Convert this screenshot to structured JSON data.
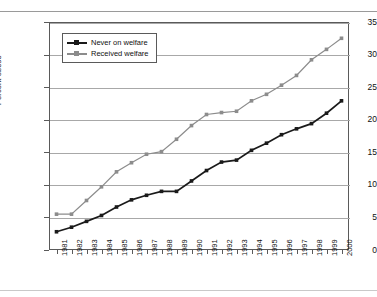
{
  "figure": {
    "top_rule": true,
    "bottom_rule": true,
    "ghost_text": ""
  },
  "legend": {
    "position": "top-left-inside",
    "entries": [
      {
        "label": "Never on welfare",
        "color": "#1a1a1a",
        "marker": "square"
      },
      {
        "label": "Received welfare",
        "color": "#8c8c8c",
        "marker": "square"
      }
    ]
  },
  "axes": {
    "y_title": "Percent obese",
    "y_ticks": [
      "0",
      "5",
      "10",
      "15",
      "20",
      "25",
      "30",
      "35"
    ],
    "x_ticks": [
      "1981",
      "1982",
      "1983",
      "1984",
      "1985",
      "1986",
      "1987",
      "1988",
      "1989",
      "1990",
      "1991",
      "1992",
      "1993",
      "1994",
      "1995",
      "1996",
      "1997",
      "1998",
      "1999",
      "2000"
    ]
  },
  "chart_data": {
    "type": "line",
    "title": "",
    "subtitle": "",
    "xlabel": "",
    "ylabel": "Percent obese",
    "xlim": [
      1981,
      2000
    ],
    "ylim": [
      0,
      35
    ],
    "y_ticks": [
      0,
      5,
      10,
      15,
      20,
      25,
      30,
      35
    ],
    "grid": "horizontal",
    "legend_position": "upper left (inside plot)",
    "x": [
      1981,
      1982,
      1983,
      1984,
      1985,
      1986,
      1987,
      1988,
      1989,
      1990,
      1991,
      1992,
      1993,
      1994,
      1995,
      1996,
      1997,
      1998,
      1999,
      2000
    ],
    "categories": [
      "1981",
      "1982",
      "1983",
      "1984",
      "1985",
      "1986",
      "1987",
      "1988",
      "1989",
      "1990",
      "1991",
      "1992",
      "1993",
      "1994",
      "1995",
      "1996",
      "1997",
      "1998",
      "1999",
      "2000"
    ],
    "series": [
      {
        "name": "Never on welfare",
        "color": "#1a1a1a",
        "marker": "square",
        "values": [
          2.8,
          3.5,
          4.4,
          5.3,
          6.6,
          7.7,
          8.4,
          9.0,
          9.0,
          10.6,
          12.2,
          13.5,
          13.8,
          15.3,
          16.4,
          17.7,
          18.6,
          19.4,
          21.0,
          22.9
        ]
      },
      {
        "name": "Received welfare",
        "color": "#8c8c8c",
        "marker": "square",
        "values": [
          5.5,
          5.5,
          7.6,
          9.7,
          12.0,
          13.4,
          14.7,
          15.1,
          17.0,
          19.1,
          20.8,
          21.1,
          21.3,
          22.9,
          23.9,
          25.3,
          26.8,
          29.2,
          30.8,
          32.5
        ]
      }
    ]
  }
}
